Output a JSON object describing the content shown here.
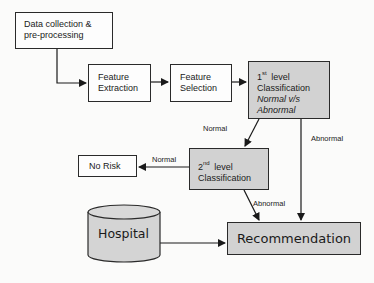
{
  "diagram": {
    "nodes": {
      "data_collection": {
        "line1": "Data collection &",
        "line2": "pre-processing"
      },
      "feature_extraction": {
        "line1": "Feature",
        "line2": "Extraction"
      },
      "feature_selection": {
        "line1": "Feature",
        "line2": "Selection"
      },
      "first_level": {
        "num": "1",
        "sup": "st",
        "word": "level",
        "line2": "Classification",
        "line3": "Normal v/s",
        "line4": "Abnormal"
      },
      "second_level": {
        "num": "2",
        "sup": "nd",
        "word": "level",
        "line2": "Classification"
      },
      "no_risk": {
        "label": "No Risk"
      },
      "hospital": {
        "label": "Hospital"
      },
      "recommendation": {
        "label": "Recommendation"
      }
    },
    "edge_labels": {
      "first_to_second": "Normal",
      "first_to_recommendation": "Abnormal",
      "second_to_no_risk": "Normal",
      "second_to_recommendation": "Abnormal"
    },
    "colors": {
      "stroke": "#2a2a2a",
      "process_fill": "#fdfdfd",
      "classifier_fill": "#d2d2d2",
      "cylinder_fill": "#d4d4d4"
    }
  }
}
